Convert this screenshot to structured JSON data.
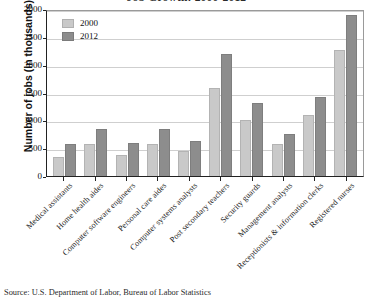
{
  "figure": {
    "title": "Job Growth: 2000-2012",
    "source_note": "Source: U.S. Department of Labor, Bureau of Labor Statistics"
  },
  "chart_data": {
    "type": "bar",
    "title": "Job Growth: 2000-2012",
    "xlabel": "",
    "ylabel": "Number of jobs (in thousands)",
    "ylim": [
      0,
      3000
    ],
    "yticks": [
      0,
      500,
      1000,
      1500,
      2000,
      2500,
      3000
    ],
    "ytick_labels": [
      "0",
      "500",
      "1000",
      "1500",
      "2000",
      "2500",
      "3000"
    ],
    "grid": true,
    "legend_position": "top-left",
    "categories": [
      "Medical assistants",
      "Home health aides",
      "Computer software engineers",
      "Personal care aides",
      "Computer systems analysts",
      "Post secondary teachers",
      "Security guards",
      "Management analysts",
      "Receptionists & information clerks",
      "Registered nurses"
    ],
    "series": [
      {
        "name": "2000",
        "color": "#c9c9c9",
        "values": [
          350,
          575,
          380,
          570,
          450,
          1590,
          1000,
          570,
          1100,
          2270
        ]
      },
      {
        "name": "2012",
        "color": "#8d8d8d",
        "values": [
          570,
          850,
          590,
          850,
          630,
          2190,
          1320,
          760,
          1420,
          2890
        ]
      }
    ]
  }
}
